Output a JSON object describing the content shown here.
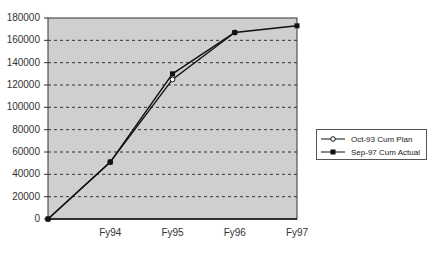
{
  "chart_data": {
    "type": "line",
    "title": "",
    "xlabel": "",
    "ylabel": "",
    "categories": [
      "",
      "Fy94",
      "Fy95",
      "Fy96",
      "Fy97"
    ],
    "ylim": [
      0,
      180000
    ],
    "yticks": [
      0,
      20000,
      40000,
      60000,
      80000,
      100000,
      120000,
      140000,
      160000,
      180000
    ],
    "ytick_labels": [
      "0",
      "20000",
      "40000",
      "60000",
      "80000",
      "100000",
      "120000",
      "140000",
      "160000",
      "180000"
    ],
    "grid": "horizontal dashed",
    "legend_position": "right",
    "series": [
      {
        "name": "Oct-93 Cum Plan",
        "marker": "open-circle",
        "values": [
          0,
          51000,
          125000,
          167000,
          null
        ]
      },
      {
        "name": "Sep-97 Cum Actual",
        "marker": "filled-square",
        "values": [
          0,
          51000,
          130000,
          167000,
          173000
        ]
      }
    ]
  },
  "colors": {
    "plot_background": "#cfcfcf",
    "line": "#111111",
    "grid": "#333333"
  },
  "legend": {
    "items": [
      {
        "label": "Oct-93 Cum Plan"
      },
      {
        "label": "Sep-97 Cum Actual"
      }
    ]
  }
}
